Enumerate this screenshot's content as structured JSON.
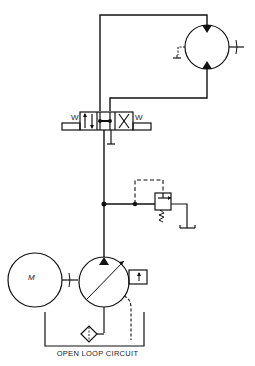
{
  "diagram": {
    "title": "OPEN LOOP CIRCUIT",
    "type": "hydraulic schematic",
    "components": [
      {
        "id": "electric-motor",
        "label": "M"
      },
      {
        "id": "variable-pump",
        "label": ""
      },
      {
        "id": "pump-compensator",
        "label": ""
      },
      {
        "id": "filter",
        "label": ""
      },
      {
        "id": "reservoir",
        "label": ""
      },
      {
        "id": "relief-valve",
        "label": ""
      },
      {
        "id": "directional-valve",
        "label": "",
        "solenoid_labels": [
          "W",
          "W"
        ]
      },
      {
        "id": "hydraulic-motor",
        "label": ""
      }
    ],
    "colors": {
      "line": "#111111",
      "background": "#ffffff"
    }
  }
}
